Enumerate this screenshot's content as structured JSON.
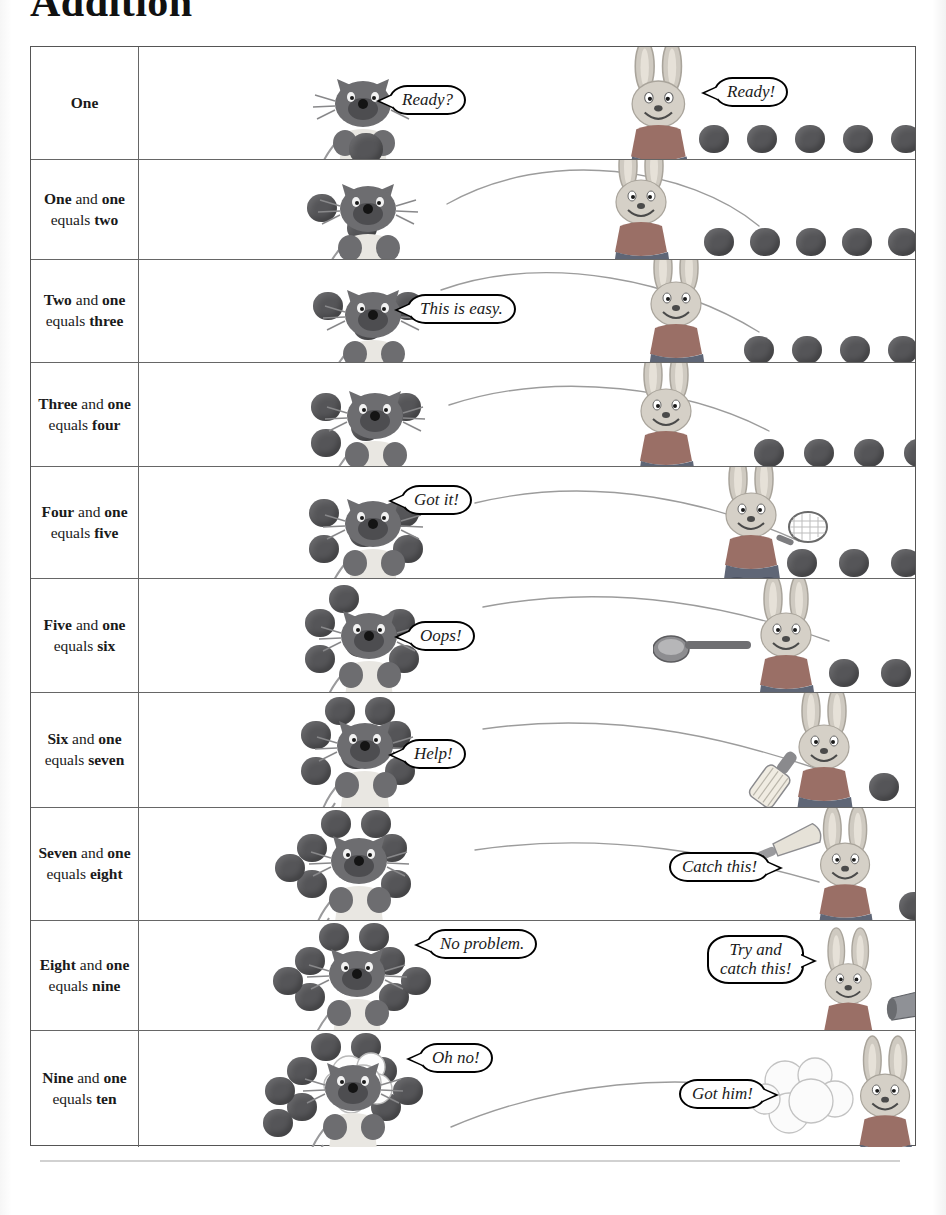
{
  "title": "Addition",
  "colors": {
    "ball": "#555558",
    "grid_line": "#666666",
    "text": "#1a1a1a",
    "cat_body": "#6d6d70",
    "rabbit_body": "#c9c4bb"
  },
  "table": {
    "rows": [
      {
        "id": "row-one",
        "label_parts": [
          {
            "t": "One",
            "bold": true
          }
        ],
        "label_plain": "One",
        "cat_balls": 1,
        "loose_balls": 8,
        "rabbit_balls": 1,
        "cat_bubble": "Ready?",
        "rabbit_bubble": "Ready!",
        "has_arc": false
      },
      {
        "id": "row-two",
        "label_parts": [
          {
            "t": "One",
            "bold": true
          },
          {
            "t": " and ",
            "bold": false
          },
          {
            "t": "one",
            "bold": true
          },
          {
            "t": " equals ",
            "bold": false
          },
          {
            "t": "two",
            "bold": true
          }
        ],
        "label_plain": "One and one equals two",
        "cat_balls": 2,
        "loose_balls": 8,
        "rabbit_balls": 0,
        "cat_bubble": "",
        "rabbit_bubble": "",
        "has_arc": true
      },
      {
        "id": "row-three",
        "label_parts": [
          {
            "t": "Two",
            "bold": true
          },
          {
            "t": " and ",
            "bold": false
          },
          {
            "t": "one",
            "bold": true
          },
          {
            "t": " equals ",
            "bold": false
          },
          {
            "t": "three",
            "bold": true
          }
        ],
        "label_plain": "Two and one equals three",
        "cat_balls": 3,
        "loose_balls": 7,
        "rabbit_balls": 0,
        "cat_bubble": "This is easy.",
        "rabbit_bubble": "",
        "has_arc": true
      },
      {
        "id": "row-four",
        "label_parts": [
          {
            "t": "Three",
            "bold": true
          },
          {
            "t": " and ",
            "bold": false
          },
          {
            "t": "one",
            "bold": true
          },
          {
            "t": " equals ",
            "bold": false
          },
          {
            "t": "four",
            "bold": true
          }
        ],
        "label_plain": "Three and one equals four",
        "cat_balls": 4,
        "loose_balls": 6,
        "rabbit_balls": 0,
        "cat_bubble": "",
        "rabbit_bubble": "",
        "has_arc": true
      },
      {
        "id": "row-five",
        "label_parts": [
          {
            "t": "Four",
            "bold": true
          },
          {
            "t": " and ",
            "bold": false
          },
          {
            "t": "one",
            "bold": true
          },
          {
            "t": " equals ",
            "bold": false
          },
          {
            "t": "five",
            "bold": true
          }
        ],
        "label_plain": "Four and one equals five",
        "cat_balls": 5,
        "loose_balls": 5,
        "rabbit_balls": 0,
        "cat_bubble": "Got it!",
        "rabbit_bubble": "",
        "rabbit_prop": "tennis-racket",
        "has_arc": true
      },
      {
        "id": "row-six",
        "label_parts": [
          {
            "t": "Five",
            "bold": true
          },
          {
            "t": " and ",
            "bold": false
          },
          {
            "t": "one",
            "bold": true
          },
          {
            "t": " equals ",
            "bold": false
          },
          {
            "t": "six",
            "bold": true
          }
        ],
        "label_plain": "Five and one equals six",
        "cat_balls": 6,
        "loose_balls": 4,
        "rabbit_balls": 0,
        "cat_bubble": "Oops!",
        "rabbit_bubble": "",
        "rabbit_prop": "ladle",
        "has_arc": true
      },
      {
        "id": "row-seven",
        "label_parts": [
          {
            "t": "Six",
            "bold": true
          },
          {
            "t": " and ",
            "bold": false
          },
          {
            "t": "one",
            "bold": true
          },
          {
            "t": " equals ",
            "bold": false
          },
          {
            "t": "seven",
            "bold": true
          }
        ],
        "label_plain": "Six and one equals seven",
        "cat_balls": 7,
        "loose_balls": 3,
        "rabbit_balls": 0,
        "cat_bubble": "Help!",
        "rabbit_bubble": "",
        "rabbit_prop": "cricket-bat",
        "has_arc": true
      },
      {
        "id": "row-eight",
        "label_parts": [
          {
            "t": "Seven",
            "bold": true
          },
          {
            "t": " and ",
            "bold": false
          },
          {
            "t": "one",
            "bold": true
          },
          {
            "t": " equals ",
            "bold": false
          },
          {
            "t": "eight",
            "bold": true
          }
        ],
        "label_plain": "Seven and one equals eight",
        "cat_balls": 8,
        "loose_balls": 2,
        "rabbit_balls": 0,
        "cat_bubble": "",
        "rabbit_bubble": "Catch this!",
        "rabbit_prop": "baseball-bat",
        "has_arc": true
      },
      {
        "id": "row-nine",
        "label_parts": [
          {
            "t": "Eight",
            "bold": true
          },
          {
            "t": " and ",
            "bold": false
          },
          {
            "t": "one",
            "bold": true
          },
          {
            "t": " equals ",
            "bold": false
          },
          {
            "t": "nine",
            "bold": true
          }
        ],
        "label_plain": "Eight and one equals nine",
        "cat_balls": 9,
        "loose_balls": 0,
        "rabbit_balls": 0,
        "cat_bubble": "No problem.",
        "rabbit_bubble": "Try and\ncatch this!",
        "rabbit_prop": "cannon",
        "has_arc": false
      },
      {
        "id": "row-ten",
        "label_parts": [
          {
            "t": "Nine",
            "bold": true
          },
          {
            "t": " and ",
            "bold": false
          },
          {
            "t": "one",
            "bold": true
          },
          {
            "t": " equals ",
            "bold": false
          },
          {
            "t": "ten",
            "bold": true
          }
        ],
        "label_plain": "Nine and one equals ten",
        "cat_balls": 10,
        "loose_balls": 0,
        "rabbit_balls": 0,
        "cat_bubble": "Oh no!",
        "rabbit_bubble": "Got him!",
        "rabbit_prop": "cannon-fired",
        "has_arc": true
      }
    ]
  }
}
